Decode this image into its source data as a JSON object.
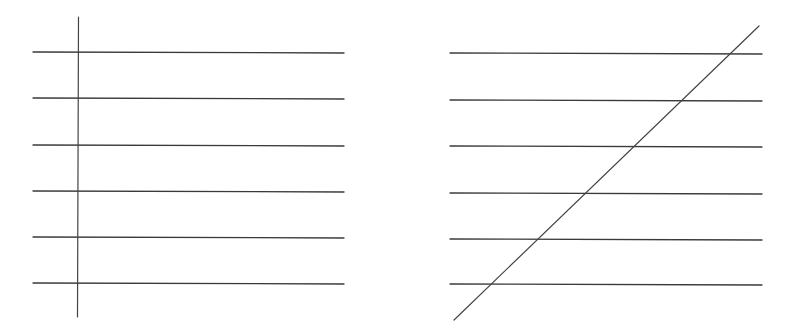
{
  "figures": [
    {
      "id": "left",
      "description": "Six parallel horizontal lines crossed by a perpendicular transversal",
      "parallel_line_count": 6,
      "transversal": "perpendicular"
    },
    {
      "id": "right",
      "description": "Six parallel horizontal lines crossed by an oblique transversal",
      "parallel_line_count": 6,
      "transversal": "oblique"
    }
  ],
  "colors": {
    "line": "#3a3a3a",
    "background": "#ffffff"
  }
}
